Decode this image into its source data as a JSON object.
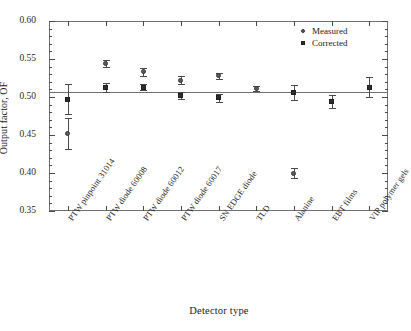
{
  "chart_data": {
    "type": "scatter",
    "title": "",
    "xlabel": "Detector type",
    "ylabel": "Output factor, OF",
    "ylim": [
      0.35,
      0.6
    ],
    "ytick_step": 0.05,
    "yticks": [
      0.35,
      0.4,
      0.45,
      0.5,
      0.55,
      0.6
    ],
    "ytick_labels": [
      "0.35",
      "0.40",
      "0.45",
      "0.50",
      "0.55",
      "0.60"
    ],
    "minor_ticks_per_major": 5,
    "grid": false,
    "legend_position": "top-right",
    "reference_line": {
      "value": 0.507,
      "orientation": "horizontal",
      "color": "#6f6f6f"
    },
    "categories": [
      "PTW pinpoint 31014",
      "PTW diode 60008",
      "PTW diode 60012",
      "PTW diode 60017",
      "SN EDGE diode",
      "TLD",
      "Alanine",
      "EBT films",
      "VIP polymer gels"
    ],
    "series": [
      {
        "name": "Measured",
        "marker": "circle",
        "color": "#5a5a5a",
        "values": [
          0.452,
          0.544,
          0.533,
          0.522,
          0.528,
          0.511,
          0.4,
          null,
          null
        ],
        "errors": [
          0.02,
          0.005,
          0.005,
          0.005,
          0.004,
          0.003,
          0.006,
          null,
          null
        ]
      },
      {
        "name": "Corrected",
        "marker": "square",
        "color": "#2e2e2e",
        "values": [
          0.497,
          0.513,
          0.513,
          0.502,
          0.499,
          null,
          0.506,
          0.494,
          0.513
        ],
        "errors": [
          0.02,
          0.006,
          0.004,
          0.004,
          0.005,
          null,
          0.01,
          0.008,
          0.013
        ]
      }
    ]
  },
  "legend": {
    "items": [
      {
        "label": "Measured",
        "marker": "circle"
      },
      {
        "label": "Corrected",
        "marker": "square"
      }
    ]
  },
  "caption": {
    "text": ""
  }
}
